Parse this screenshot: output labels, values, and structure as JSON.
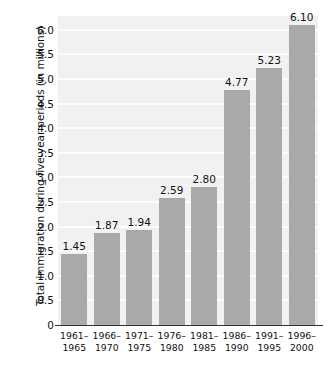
{
  "chart_data": {
    "type": "bar",
    "title": "",
    "xlabel": "",
    "ylabel": "Total immigration during five-year periods (in millions)",
    "categories": [
      "1961–1965",
      "1966–1970",
      "1971–1975",
      "1976–1980",
      "1981–1985",
      "1986–1990",
      "1991–1995",
      "1996–2000"
    ],
    "category_lines": [
      [
        "1961–",
        "1965"
      ],
      [
        "1966–",
        "1970"
      ],
      [
        "1971–",
        "1975"
      ],
      [
        "1976–",
        "1980"
      ],
      [
        "1981–",
        "1985"
      ],
      [
        "1986–",
        "1990"
      ],
      [
        "1991–",
        "1995"
      ],
      [
        "1996–",
        "2000"
      ]
    ],
    "values": [
      1.45,
      1.87,
      1.94,
      2.59,
      2.8,
      4.77,
      5.23,
      6.1
    ],
    "value_labels": [
      "1.45",
      "1.87",
      "1.94",
      "2.59",
      "2.80",
      "4.77",
      "5.23",
      "6.10"
    ],
    "ylim": [
      0,
      6.28
    ],
    "yticks": [
      0,
      0.5,
      1.0,
      1.5,
      2.0,
      2.5,
      3.0,
      3.5,
      4.0,
      4.5,
      5.0,
      5.5,
      6.0
    ],
    "ytick_labels": [
      "0",
      "0.5",
      "1.0",
      "1.5",
      "2.0",
      "2.5",
      "3.0",
      "3.5",
      "4.0",
      "4.5",
      "5.0",
      "5.5",
      "6.0"
    ],
    "grid": true,
    "grid_axis": "y",
    "legend": false,
    "colors": {
      "bar_fill": "#a9a9a9",
      "plot_background": "#f1f1f1",
      "gridline": "#fdfdfd",
      "axis_line": "#333333",
      "text": "#111111",
      "page_background": "#ffffff"
    }
  }
}
